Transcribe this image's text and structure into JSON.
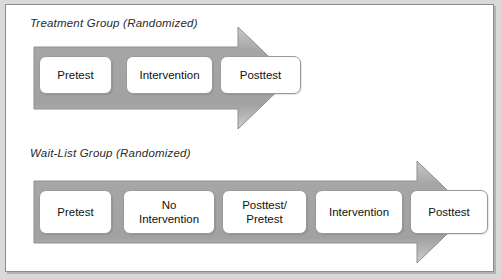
{
  "figure": {
    "name": "experimental-design-diagram",
    "panels": [
      {
        "id": "treatment",
        "title": "Treatment Group (Randomized)",
        "arrow": {
          "name": "process-arrow",
          "direction": "right",
          "fill": "#a9a9a9",
          "stroke": "#8a8a8a"
        },
        "steps": [
          {
            "label": "Pretest",
            "name": "step-pretest"
          },
          {
            "label": "Intervention",
            "name": "step-intervention"
          },
          {
            "label": "Posttest",
            "name": "step-posttest"
          }
        ]
      },
      {
        "id": "waitlist",
        "title": "Wait-List Group (Randomized)",
        "arrow": {
          "name": "process-arrow",
          "direction": "right",
          "fill": "#a9a9a9",
          "stroke": "#8a8a8a"
        },
        "steps": [
          {
            "label": "Pretest",
            "name": "step-pretest"
          },
          {
            "label": "No\nIntervention",
            "line1": "No",
            "line2": "Intervention",
            "name": "step-no-intervention"
          },
          {
            "label": "Posttest/\nPretest",
            "line1": "Posttest/",
            "line2": "Pretest",
            "name": "step-posttest-pretest"
          },
          {
            "label": "Intervention",
            "name": "step-intervention"
          },
          {
            "label": "Posttest",
            "name": "step-posttest"
          }
        ]
      }
    ],
    "colors": {
      "page_background": "#d9d9d9",
      "panel_background": "#ffffff",
      "panel_border": "#8d8d8d",
      "arrow_fill": "#a9a9a9",
      "box_border": "#9a9a9a",
      "text": "#111111"
    }
  }
}
